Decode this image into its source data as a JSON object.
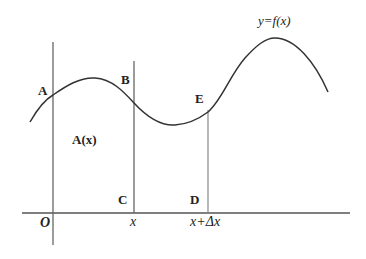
{
  "diagram": {
    "curve_label": "y=f(x)",
    "points": {
      "A": "A",
      "B": "B",
      "C": "C",
      "D": "D",
      "E": "E"
    },
    "area_label": "A(x)",
    "axis_labels": {
      "origin": "O",
      "x": "x",
      "x_plus_dx": "x+Δx"
    },
    "colors": {
      "line": "#555555",
      "curve": "#333333",
      "background": "#ffffff"
    }
  }
}
